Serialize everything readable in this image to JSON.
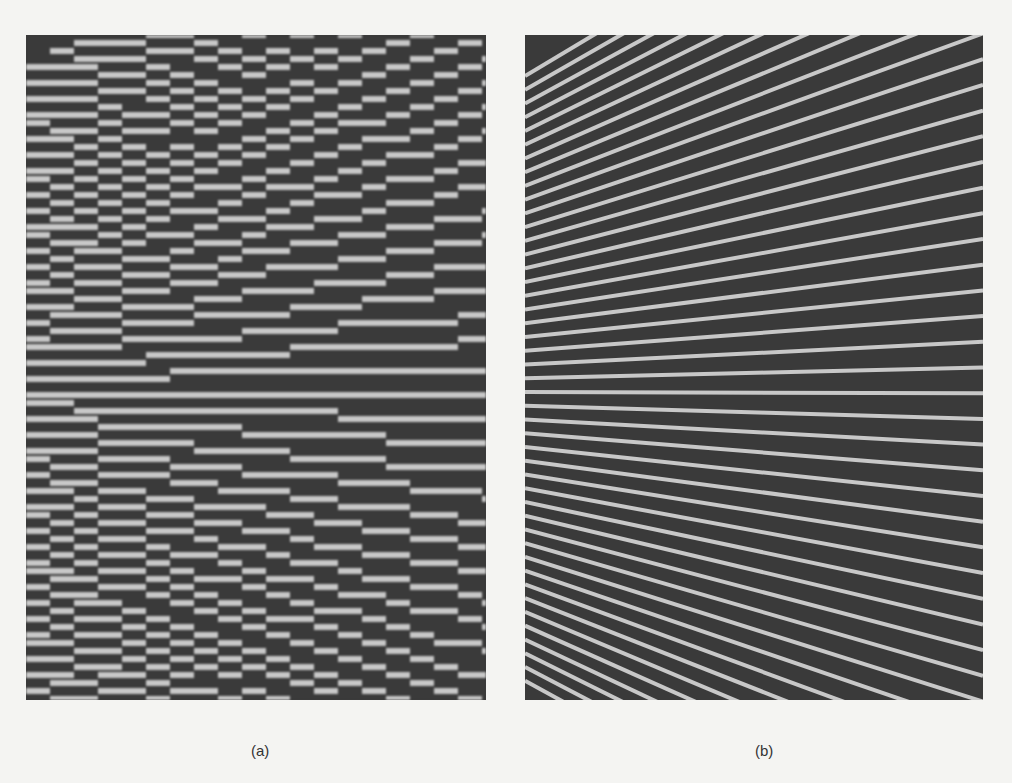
{
  "figure": {
    "panels": [
      {
        "id": "a",
        "caption": "(a)",
        "description": "Converging line pattern rendered with aliasing (jagged, stair-stepped lines)",
        "rendering": "aliased"
      },
      {
        "id": "b",
        "caption": "(b)",
        "description": "Converging line pattern rendered with anti-aliasing (smooth lines)",
        "rendering": "antialiased"
      }
    ],
    "colors": {
      "background": "#f4f4f2",
      "line_dark": "#3a3a3a",
      "line_light": "#c8c8c8"
    },
    "line_count": 44
  }
}
